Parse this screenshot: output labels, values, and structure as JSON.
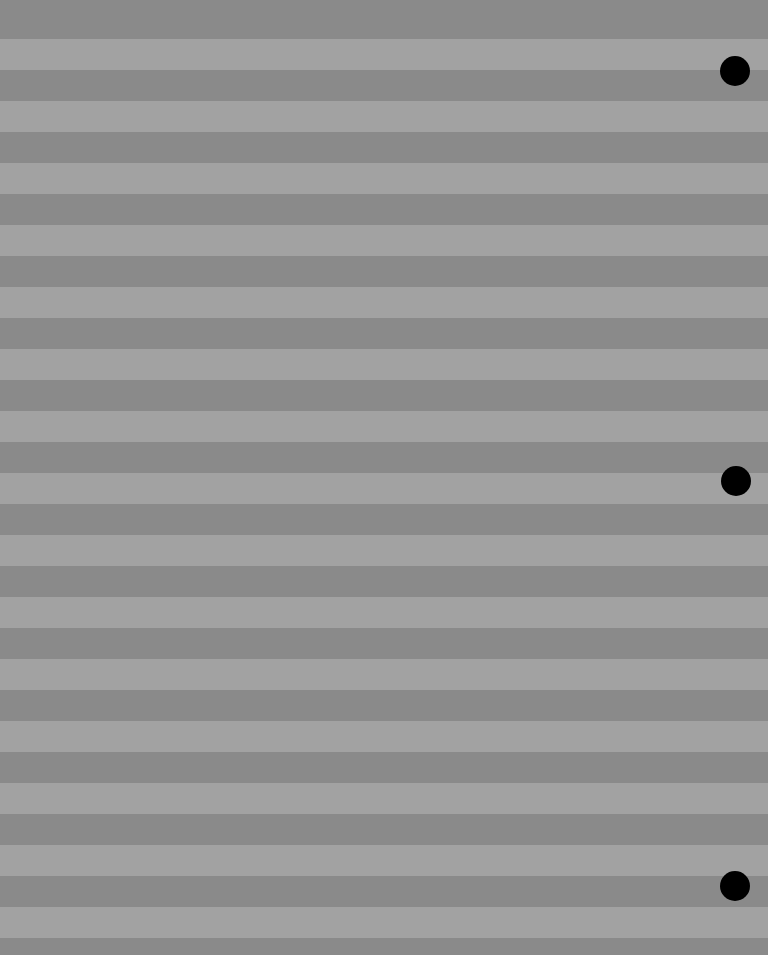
{
  "sheet": {
    "width": 768,
    "height": 955,
    "colors": {
      "dark_stripe": "#8a8a8a",
      "light_stripe": "#a2a2a2",
      "hole": "#000000"
    },
    "stripes": {
      "first_dark_height": 39,
      "period": 62,
      "light_height": 31,
      "dark_height": 31
    },
    "holes": [
      {
        "cx": 735,
        "cy": 71,
        "d": 30
      },
      {
        "cx": 736,
        "cy": 481,
        "d": 30
      },
      {
        "cx": 735,
        "cy": 886,
        "d": 30
      }
    ]
  }
}
